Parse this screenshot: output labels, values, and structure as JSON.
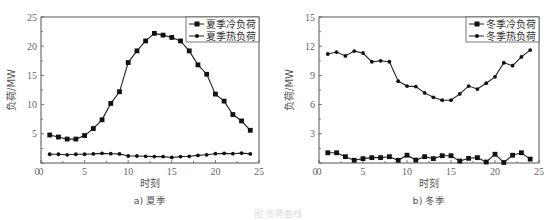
{
  "chart_data": [
    {
      "type": "line",
      "title": "",
      "subcaption": "a) 夏季",
      "xlabel": "时刻",
      "ylabel": "负荷/MW",
      "xlim": [
        0,
        25
      ],
      "ylim": [
        0,
        25
      ],
      "xticks": [
        0,
        5,
        10,
        15,
        20,
        25
      ],
      "yticks": [
        0,
        5,
        10,
        15,
        20,
        25
      ],
      "grid": false,
      "legend_position": "top-right",
      "x": [
        1,
        2,
        3,
        4,
        5,
        6,
        7,
        8,
        9,
        10,
        11,
        12,
        13,
        14,
        15,
        16,
        17,
        18,
        19,
        20,
        21,
        22,
        23,
        24
      ],
      "series": [
        {
          "name": "夏季冷负荷",
          "marker": "square",
          "values": [
            4.8,
            4.45,
            4.1,
            4.1,
            4.7,
            5.9,
            7.4,
            10.2,
            12.2,
            17.2,
            19.2,
            20.9,
            22.2,
            21.9,
            21.5,
            20.9,
            19.2,
            16.8,
            15.2,
            11.8,
            10.6,
            8.3,
            7.2,
            5.6
          ]
        },
        {
          "name": "夏季热负荷",
          "marker": "dot",
          "values": [
            1.5,
            1.5,
            1.4,
            1.5,
            1.5,
            1.55,
            1.65,
            1.6,
            1.55,
            1.2,
            1.2,
            1.15,
            1.1,
            1.1,
            0.95,
            1.1,
            1.15,
            1.3,
            1.4,
            1.6,
            1.65,
            1.6,
            1.7,
            1.55
          ]
        }
      ]
    },
    {
      "type": "line",
      "title": "",
      "subcaption": "b) 冬季",
      "xlabel": "时刻",
      "ylabel": "负荷/MW",
      "xlim": [
        0,
        25
      ],
      "ylim": [
        0,
        15
      ],
      "xticks": [
        0,
        5,
        10,
        15,
        20,
        25
      ],
      "yticks": [
        0,
        3,
        6,
        9,
        12,
        15
      ],
      "grid": false,
      "legend_position": "top-right",
      "x": [
        1,
        2,
        3,
        4,
        5,
        6,
        7,
        8,
        9,
        10,
        11,
        12,
        13,
        14,
        15,
        16,
        17,
        18,
        19,
        20,
        21,
        22,
        23,
        24
      ],
      "series": [
        {
          "name": "冬季冷负荷",
          "marker": "square",
          "values": [
            1.05,
            1.05,
            0.65,
            0.28,
            0.45,
            0.55,
            0.55,
            0.65,
            0.28,
            0.8,
            0.3,
            0.65,
            0.45,
            0.75,
            0.75,
            0.2,
            0.48,
            0.55,
            0.1,
            0.9,
            0.05,
            0.8,
            1.05,
            0.4
          ]
        },
        {
          "name": "冬季热负荷",
          "marker": "dot",
          "values": [
            11.2,
            11.4,
            11.0,
            11.5,
            11.3,
            10.4,
            10.5,
            10.4,
            8.4,
            7.9,
            7.85,
            7.2,
            6.75,
            6.45,
            6.45,
            7.1,
            7.9,
            7.6,
            8.2,
            8.85,
            10.3,
            10.0,
            10.9,
            11.6
          ]
        }
      ]
    }
  ],
  "figure_caption_faint": "图 负荷曲线"
}
